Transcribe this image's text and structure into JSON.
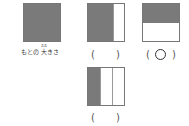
{
  "figures": [
    {
      "id": "original",
      "caption": "もとの 大きさ",
      "caption_prefix": "もとの ",
      "caption_kanji": "大",
      "caption_suffix": "きさ",
      "furigana": "おお",
      "shaded_fraction": "1",
      "orientation": "full"
    },
    {
      "id": "option-a",
      "shaded_fraction": "2/3",
      "orientation": "vertical",
      "answer_open": "(",
      "answer_close": ")",
      "answer_mark": ""
    },
    {
      "id": "option-b",
      "shaded_fraction": "1/2",
      "orientation": "horizontal",
      "answer_open": "(",
      "answer_close": ")",
      "answer_mark": "○"
    },
    {
      "id": "option-c",
      "shaded_fraction": "1/3",
      "orientation": "vertical",
      "answer_open": "(",
      "answer_close": ")",
      "answer_mark": ""
    }
  ],
  "colors": {
    "shade": "#7a7a7a",
    "border": "#777777"
  }
}
